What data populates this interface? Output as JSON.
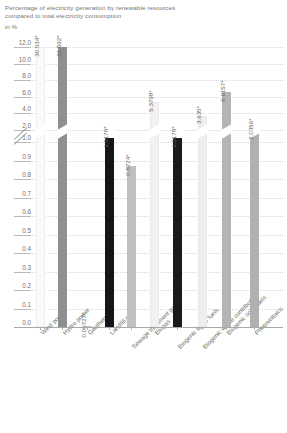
{
  "title": {
    "line1": "Percentage of electricity generation by renewable resources",
    "line2": "compared to total electricity consumption",
    "unit": "in %"
  },
  "chart_data": {
    "type": "bar",
    "title": "Percentage of electricity generation by renewable resources compared to total electricity consumption",
    "xlabel": "",
    "ylabel": "in %",
    "ylim": [
      0,
      12
    ],
    "grid": true,
    "legend": false,
    "axis_break": {
      "present": true,
      "between": [
        1.0,
        2.0
      ]
    },
    "ytick_labels": [
      "12.0",
      "10.0",
      "8.0",
      "6.0",
      "4.0",
      "2.0",
      "1.0",
      "0.9",
      "0.8",
      "0.7",
      "0.6",
      "0.5",
      "0.4",
      "0.3",
      "0.2",
      "0.1",
      "0.0"
    ],
    "categories": [
      "Wind power",
      "Hydro power",
      "Geothermal",
      "Landfill gas",
      "Sewage treatment gas",
      "Biogas",
      "Biogenic liquid fuels",
      "Biogenic waste contribution",
      "Biogenic solid fuels",
      "Photovoltaics"
    ],
    "values": [
      30.534,
      21.592,
      0.00727,
      1.0178,
      0.8724,
      5.3798,
      1.0178,
      3.635,
      6.6157,
      2.0356
    ],
    "data_labels": [
      "30.534*",
      "21.592*",
      "0.00727*",
      "1.0178*",
      "0.8724*",
      "5.3798*",
      "1.0178*",
      "3.635*",
      "6.6157*",
      "2.0356*"
    ],
    "bar_colors": [
      "#fafafa",
      "#8f8f8f",
      "#c9c9c9",
      "#161616",
      "#c0c0c0",
      "#f2f2f2",
      "#1a1a1a",
      "#eeeeee",
      "#b4b4b4",
      "#b0b0b0"
    ],
    "note": "* value exceeds upper axis range for bars drawn beyond the break"
  },
  "colors": {
    "text": "#6f6f6f",
    "grid": "#d7d7d7",
    "axis": "#a9a9a9",
    "background": "#ffffff"
  }
}
